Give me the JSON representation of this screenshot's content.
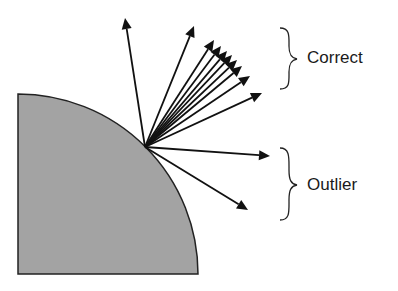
{
  "diagram": {
    "type": "surface-normal-vectors",
    "colors": {
      "surface_fill": "#a3a3a3",
      "surface_edge": "#222222",
      "arrow": "#111111",
      "text": "#1a1a1a"
    },
    "surface": {
      "center": [
        18,
        274
      ],
      "radius": 180
    },
    "origin": [
      145,
      147
    ],
    "arrows": [
      {
        "group": "correct",
        "tip": [
          125,
          18
        ]
      },
      {
        "group": "correct",
        "tip": [
          194,
          26
        ]
      },
      {
        "group": "correct",
        "tip": [
          214,
          40
        ]
      },
      {
        "group": "correct",
        "tip": [
          221,
          46
        ]
      },
      {
        "group": "correct",
        "tip": [
          227,
          51
        ]
      },
      {
        "group": "correct",
        "tip": [
          232,
          55
        ]
      },
      {
        "group": "correct",
        "tip": [
          237,
          60
        ]
      },
      {
        "group": "correct",
        "tip": [
          242,
          66
        ]
      },
      {
        "group": "correct",
        "tip": [
          250,
          76
        ]
      },
      {
        "group": "correct",
        "tip": [
          262,
          93
        ]
      },
      {
        "group": "outlier",
        "tip": [
          270,
          156
        ]
      },
      {
        "group": "outlier",
        "tip": [
          248,
          210
        ]
      }
    ],
    "labels": {
      "correct": "Correct",
      "outlier": "Outlier"
    }
  }
}
